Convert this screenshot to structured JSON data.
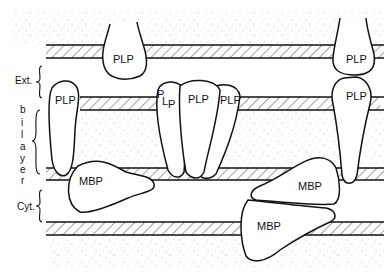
{
  "diagram": {
    "title": "",
    "proteins": {
      "plp_top_left": "PLP",
      "plp_top_right": "PLP",
      "plp_mid_left": "PLP",
      "plp_cluster_a": "PLP",
      "plp_cluster_b": "PLP",
      "plp_cluster_c": "PLP",
      "plp_mid_right": "PLP",
      "mbp_left": "MBP",
      "mbp_right_upper": "MBP",
      "mbp_right_lower": "MBP"
    },
    "side_labels": {
      "ext": "Ext.",
      "bilayer": [
        "b",
        "i",
        "l",
        "a",
        "y",
        "e",
        "r"
      ],
      "cyt": "Cyt."
    },
    "colors": {
      "stroke": "#111111",
      "hatch": "#444444",
      "stipple": "#9a9a9a",
      "background": "#ffffff"
    }
  }
}
